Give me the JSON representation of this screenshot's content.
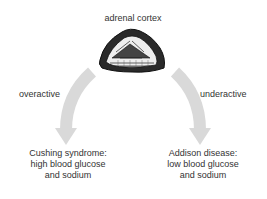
{
  "title": "adrenal cortex",
  "left": {
    "arrow_label": "overactive",
    "outcome_lines": [
      "Cushing syndrome:",
      "high blood glucose",
      "and sodium"
    ]
  },
  "right": {
    "arrow_label": "underactive",
    "outcome_lines": [
      "Addison disease:",
      "low blood glucose",
      "and sodium"
    ]
  },
  "colors": {
    "arrow": "#d9d9d9",
    "text": "#333333",
    "gland": "#1a1a1a"
  }
}
